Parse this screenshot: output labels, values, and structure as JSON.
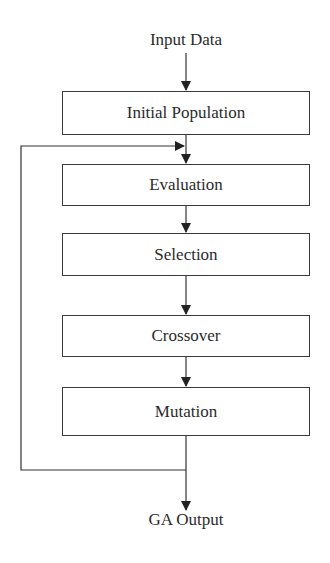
{
  "diagram": {
    "type": "flowchart",
    "input_label": "Input Data",
    "output_label": "GA Output",
    "steps": [
      {
        "label": "Initial Population"
      },
      {
        "label": "Evaluation"
      },
      {
        "label": "Selection"
      },
      {
        "label": "Crossover"
      },
      {
        "label": "Mutation"
      }
    ],
    "edges": [
      {
        "from": "Input Data",
        "to": "Initial Population"
      },
      {
        "from": "Initial Population",
        "to": "Evaluation"
      },
      {
        "from": "Evaluation",
        "to": "Selection"
      },
      {
        "from": "Selection",
        "to": "Crossover"
      },
      {
        "from": "Crossover",
        "to": "Mutation"
      },
      {
        "from": "Mutation",
        "to": "Evaluation",
        "kind": "feedback-loop"
      },
      {
        "from": "Mutation",
        "to": "GA Output"
      }
    ],
    "line_color": "#2b2b2b"
  }
}
